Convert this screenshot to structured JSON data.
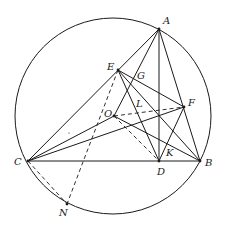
{
  "diagram": {
    "type": "geometry-construction",
    "circle": {
      "cx": 113,
      "cy": 116,
      "r": 98
    },
    "points": {
      "A": {
        "x": 159,
        "y": 29,
        "label": "A",
        "lx": 163,
        "ly": 24
      },
      "B": {
        "x": 200,
        "y": 161,
        "label": "B",
        "lx": 205,
        "ly": 166
      },
      "C": {
        "x": 28,
        "y": 161,
        "label": "C",
        "lx": 14,
        "ly": 165
      },
      "D": {
        "x": 159,
        "y": 161,
        "label": "D",
        "lx": 157,
        "ly": 175
      },
      "E": {
        "x": 118,
        "y": 70,
        "label": "E",
        "lx": 107,
        "ly": 70
      },
      "F": {
        "x": 184,
        "y": 107,
        "label": "F",
        "lx": 188,
        "ly": 106
      },
      "G": {
        "x": 138,
        "y": 76,
        "label": "G",
        "lx": 137,
        "ly": 79
      },
      "O": {
        "x": 114,
        "y": 116,
        "label": "O",
        "lx": 104,
        "ly": 117
      },
      "L": {
        "x": 140,
        "y": 108,
        "label": "L",
        "lx": 136,
        "ly": 107
      },
      "K": {
        "x": 163,
        "y": 151,
        "label": "K",
        "lx": 166,
        "ly": 156
      },
      "N": {
        "x": 67,
        "y": 204,
        "label": "N",
        "lx": 59,
        "ly": 216
      }
    },
    "solid_segments": [
      [
        "C",
        "A"
      ],
      [
        "C",
        "B"
      ],
      [
        "A",
        "B"
      ],
      [
        "A",
        "D"
      ],
      [
        "C",
        "O"
      ],
      [
        "C",
        "F"
      ],
      [
        "O",
        "A"
      ],
      [
        "O",
        "B"
      ],
      [
        "E",
        "F"
      ],
      [
        "E",
        "B"
      ],
      [
        "E",
        "D"
      ],
      [
        "F",
        "D"
      ]
    ],
    "dashed_segments": [
      [
        "E",
        "N"
      ],
      [
        "C",
        "N"
      ],
      [
        "O",
        "F"
      ],
      [
        "O",
        "D"
      ]
    ]
  }
}
